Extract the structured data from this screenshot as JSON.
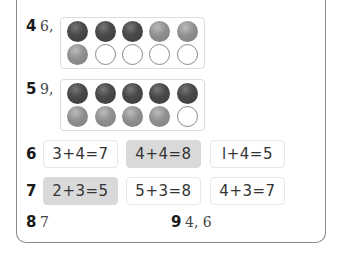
{
  "questions": {
    "q4": {
      "number": "4",
      "answer": "6,",
      "frame": {
        "top": [
          "dark",
          "dark",
          "dark",
          "mid",
          "mid"
        ],
        "bottom": [
          "mid",
          "empty",
          "empty",
          "empty",
          "empty"
        ]
      }
    },
    "q5": {
      "number": "5",
      "answer": "9,",
      "frame": {
        "top": [
          "dark",
          "dark",
          "dark",
          "dark",
          "dark"
        ],
        "bottom": [
          "mid",
          "mid",
          "mid",
          "mid",
          "empty"
        ]
      }
    },
    "q6": {
      "number": "6",
      "options": [
        {
          "text": "3+4=7",
          "highlighted": false
        },
        {
          "text": "4+4=8",
          "highlighted": true
        },
        {
          "text": "l+4=5",
          "highlighted": false
        }
      ]
    },
    "q7": {
      "number": "7",
      "options": [
        {
          "text": "2+3=5",
          "highlighted": true
        },
        {
          "text": "5+3=8",
          "highlighted": false
        },
        {
          "text": "4+3=7",
          "highlighted": false
        }
      ]
    },
    "q8": {
      "number": "8",
      "answer": "7"
    },
    "q9": {
      "number": "9",
      "answer": "4, 6"
    }
  },
  "colors": {
    "highlight": "#d9d9d9",
    "dark_counter": "#3f3f3f",
    "mid_counter": "#8f8f8f",
    "border": "#8a8a8a"
  }
}
